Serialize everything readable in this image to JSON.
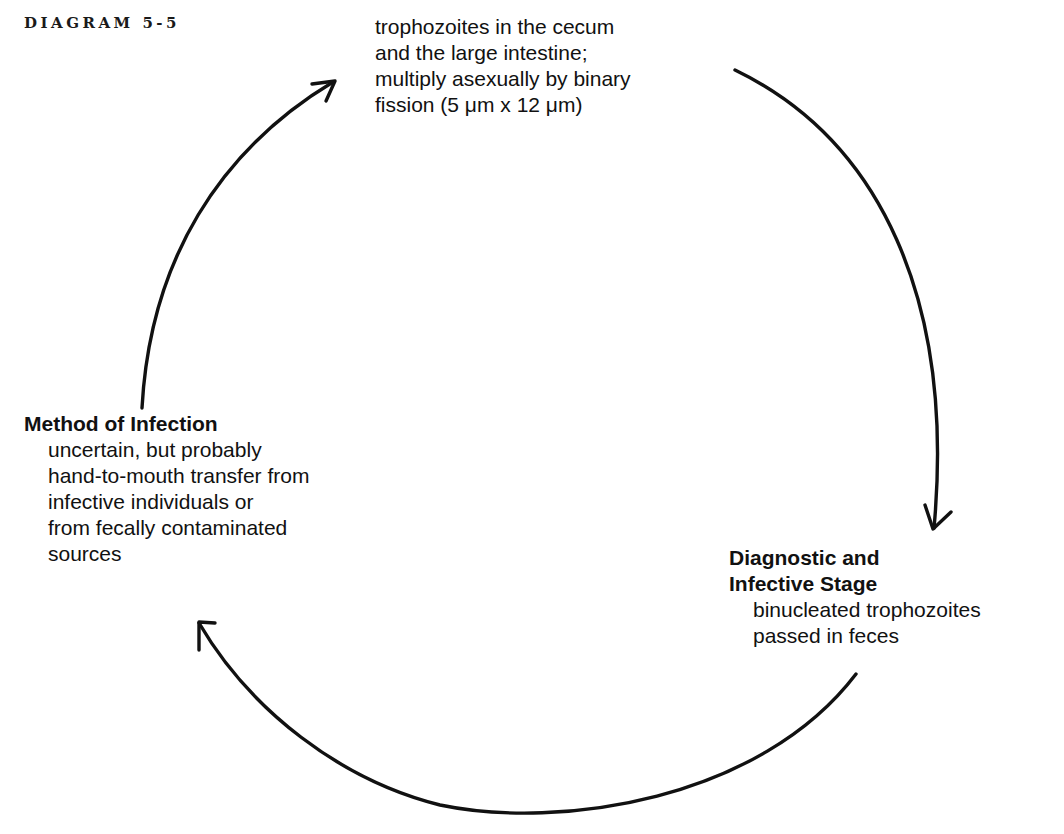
{
  "figure": {
    "label": "DIAGRAM 5-5"
  },
  "stages": {
    "intestinal_stage": {
      "lines": [
        "trophozoites in the cecum",
        "and the large intestine;",
        "multiply asexually by binary",
        "fission (5 μm x 12 μm)"
      ]
    },
    "diagnostic_stage": {
      "heading_lines": [
        "Diagnostic and",
        "Infective Stage"
      ],
      "lines": [
        "binucleated trophozoites",
        "passed in feces"
      ]
    },
    "method_of_infection": {
      "heading": "Method of Infection",
      "lines": [
        "uncertain, but probably",
        "hand-to-mouth transfer from",
        "infective individuals or",
        "from fecally contaminated",
        "sources"
      ]
    }
  },
  "cycle": {
    "arrows": [
      {
        "from": "method_of_infection",
        "to": "intestinal_stage",
        "icon": "arrow-up-right-icon"
      },
      {
        "from": "intestinal_stage",
        "to": "diagnostic_stage",
        "icon": "arrow-down-icon"
      },
      {
        "from": "diagnostic_stage",
        "to": "method_of_infection",
        "icon": "arrow-up-left-icon"
      }
    ],
    "stroke_color": "#111111"
  }
}
